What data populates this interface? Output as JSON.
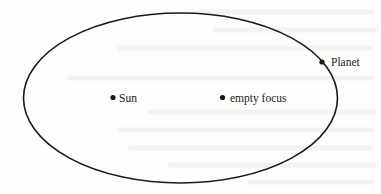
{
  "diagram": {
    "colors": {
      "stroke": "#1a1a1a",
      "background": "#fdfdfc",
      "text": "#1a1a1a"
    },
    "orbit": {
      "cx": 180.5,
      "cy": 98,
      "rx": 157,
      "ry": 85
    },
    "points": [
      {
        "id": "sun",
        "label": "Sun",
        "x": 113,
        "y": 97.5
      },
      {
        "id": "empty-focus",
        "label": "empty focus",
        "x": 222.5,
        "y": 97.5
      },
      {
        "id": "planet",
        "label": "Planet",
        "x": 322,
        "y": 62
      }
    ]
  }
}
